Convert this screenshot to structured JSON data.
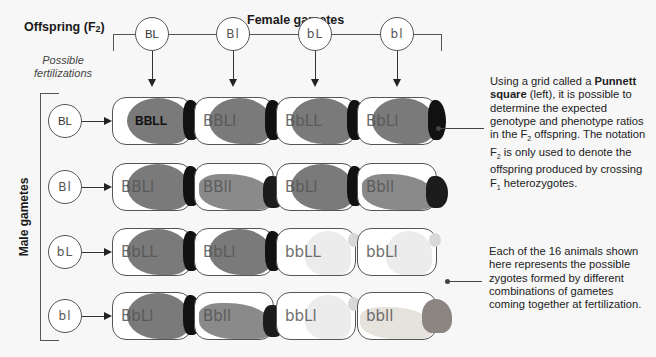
{
  "title": {
    "prefix": "Offspring (F",
    "sub": "2",
    "suffix": ")"
  },
  "female_gametes_label": "Female gametes",
  "male_gametes_label": "Male gametes",
  "possible_fertilizations": [
    "Possible",
    "fertilizations"
  ],
  "female_gametes": [
    "BL",
    "Bl",
    "bL",
    "bl"
  ],
  "male_gametes": [
    "BL",
    "Bl",
    "bL",
    "bl"
  ],
  "grid": [
    [
      {
        "genotype": "BBLL",
        "phenotype": "black-rough"
      },
      {
        "genotype": "BBLl",
        "phenotype": "black-rough"
      },
      {
        "genotype": "BbLL",
        "phenotype": "black-rough"
      },
      {
        "genotype": "BbLl",
        "phenotype": "black-rough"
      }
    ],
    [
      {
        "genotype": "BBLl",
        "phenotype": "black-rough"
      },
      {
        "genotype": "BBll",
        "phenotype": "black-smooth"
      },
      {
        "genotype": "BbLl",
        "phenotype": "black-rough"
      },
      {
        "genotype": "Bbll",
        "phenotype": "black-smooth"
      }
    ],
    [
      {
        "genotype": "BbLL",
        "phenotype": "black-rough"
      },
      {
        "genotype": "BbLl",
        "phenotype": "black-rough"
      },
      {
        "genotype": "bbLL",
        "phenotype": "white-rough"
      },
      {
        "genotype": "bbLl",
        "phenotype": "white-rough"
      }
    ],
    [
      {
        "genotype": "BbLl",
        "phenotype": "black-rough"
      },
      {
        "genotype": "Bbll",
        "phenotype": "black-smooth"
      },
      {
        "genotype": "bbLl",
        "phenotype": "white-rough"
      },
      {
        "genotype": "bbll",
        "phenotype": "white-smooth"
      }
    ]
  ],
  "annotation_1": {
    "p1": "Using a grid called a ",
    "bold": "Punnett square",
    "p2": " (left), it is possible to determine the expected genotype and phenotype ratios in the F",
    "sub1": "2",
    "p3": " offspring. The notation F",
    "sub2": "2",
    "p4": " is only used to denote the offspring produced by crossing F",
    "sub3": "1",
    "p5": " heterozygotes."
  },
  "annotation_2": {
    "text": "Each of the 16 animals shown here represents the possible zygotes formed by different combinations of gametes coming together at fertilization."
  },
  "colors": {
    "line": "#555555",
    "background": "#f7f7f7",
    "dark_coat": "#7a7a7a",
    "white_coat": "#ececec"
  }
}
